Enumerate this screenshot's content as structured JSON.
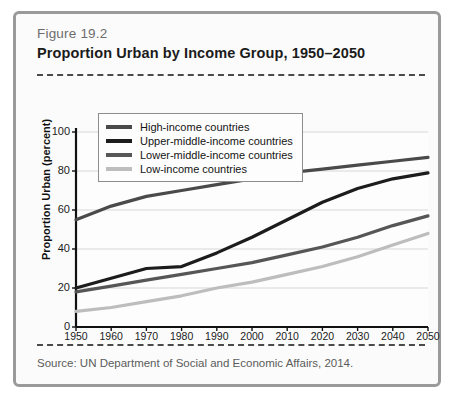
{
  "figure": {
    "number": "Figure 19.2",
    "title": "Proportion Urban by Income Group, 1950–2050",
    "source": "Source: UN Department of Social and Economic Affairs, 2014."
  },
  "chart_data": {
    "type": "line",
    "title": "Proportion Urban by Income Group, 1950–2050",
    "xlabel": "",
    "ylabel": "Proportion Urban (percent)",
    "x": [
      1950,
      1960,
      1970,
      1980,
      1990,
      2000,
      2010,
      2020,
      2030,
      2040,
      2050
    ],
    "xlim": [
      1950,
      2050
    ],
    "ylim": [
      0,
      100
    ],
    "yticks": [
      0,
      20,
      40,
      60,
      80,
      100
    ],
    "xticks": [
      "1950",
      "1960",
      "1970",
      "1980",
      "1990",
      "2000",
      "2010",
      "2020",
      "2030",
      "2040",
      "2050"
    ],
    "grid": true,
    "legend_position": "top-left-inside",
    "series": [
      {
        "name": "High-income countries",
        "color": "#4a4a4a",
        "values": [
          55,
          62,
          67,
          70,
          73,
          76,
          79,
          81,
          83,
          85,
          87
        ]
      },
      {
        "name": "Upper-middle-income countries",
        "color": "#1c1c1c",
        "values": [
          20,
          25,
          30,
          31,
          38,
          46,
          55,
          64,
          71,
          76,
          79
        ]
      },
      {
        "name": "Lower-middle-income countries",
        "color": "#565656",
        "values": [
          18,
          21,
          24,
          27,
          30,
          33,
          37,
          41,
          46,
          52,
          57
        ]
      },
      {
        "name": "Low-income countries",
        "color": "#bdbdbd",
        "values": [
          8,
          10,
          13,
          16,
          20,
          23,
          27,
          31,
          36,
          42,
          48
        ]
      }
    ]
  },
  "axes": {
    "y_ticks": [
      "100",
      "80",
      "60",
      "40",
      "20",
      "0"
    ],
    "y_title": "Proportion Urban (percent)"
  }
}
